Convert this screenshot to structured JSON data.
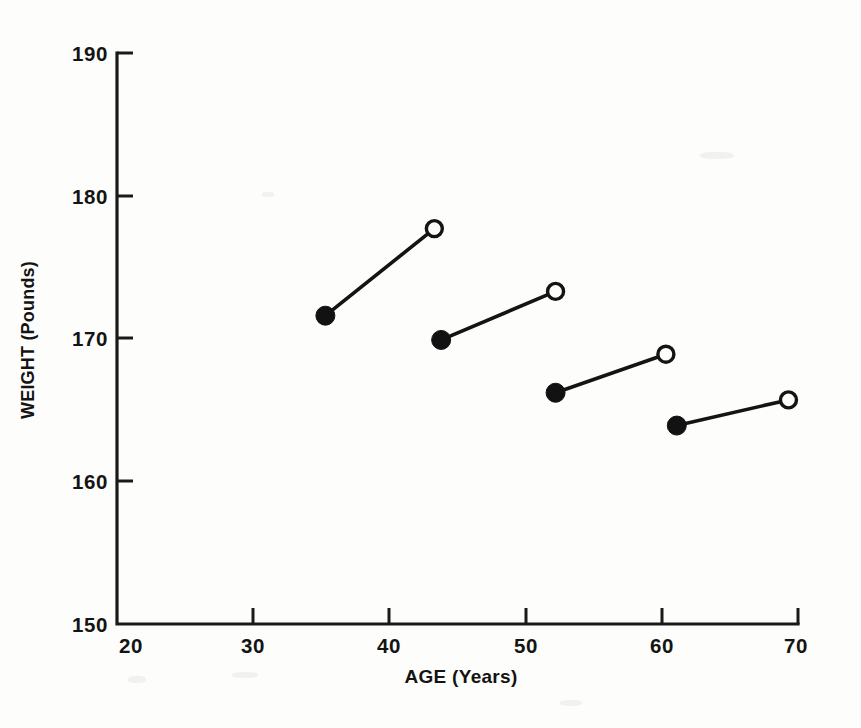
{
  "figure": {
    "background_color": "#fdfdfb",
    "ink_color": "#141414"
  },
  "chart_data": {
    "type": "scatter",
    "title": "",
    "xlabel": "AGE (Years)",
    "ylabel": "WEIGHT (Pounds)",
    "xlim": [
      20,
      70
    ],
    "ylim": [
      150,
      190
    ],
    "xticks": [
      20,
      30,
      40,
      50,
      60,
      70
    ],
    "yticks": [
      150,
      160,
      170,
      180,
      190
    ],
    "xtick_labels": [
      "20",
      "30",
      "40",
      "50",
      "60",
      "70"
    ],
    "ytick_labels": [
      "150",
      "160",
      "170",
      "180",
      "190"
    ],
    "grid": false,
    "legend": "none",
    "marker_styles": {
      "start": "filled-circle",
      "end": "open-circle"
    },
    "series": [
      {
        "name": "segment-1",
        "x": [
          35.3,
          43.3
        ],
        "y": [
          171.6,
          177.7
        ]
      },
      {
        "name": "segment-2",
        "x": [
          43.8,
          52.2
        ],
        "y": [
          169.9,
          173.3
        ]
      },
      {
        "name": "segment-3",
        "x": [
          52.2,
          60.3
        ],
        "y": [
          166.2,
          168.9
        ]
      },
      {
        "name": "segment-4",
        "x": [
          61.1,
          69.3
        ],
        "y": [
          163.9,
          165.7
        ]
      }
    ]
  }
}
